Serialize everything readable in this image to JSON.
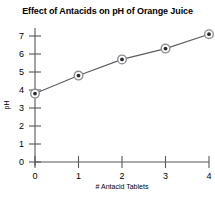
{
  "chart_data": {
    "type": "line",
    "title": "Effect of Antacids on pH of Orange Juice",
    "xlabel": "# Antacid Tablets",
    "ylabel": "pH",
    "x": [
      0,
      1,
      2,
      3,
      4
    ],
    "values": [
      3.8,
      4.8,
      5.7,
      6.3,
      7.1
    ],
    "categories": [
      "0",
      "1",
      "2",
      "3",
      "4"
    ],
    "xlim": [
      0,
      4
    ],
    "ylim": [
      0,
      7
    ],
    "xticks": [
      "0",
      "1",
      "2",
      "3",
      "4"
    ],
    "yticks": [
      "0",
      "1",
      "2",
      "3",
      "4",
      "5",
      "6",
      "7"
    ],
    "grid": false,
    "legend": false,
    "marker": "circle",
    "line_color": "#5a5c5f",
    "marker_fill": "#2b2c2e",
    "marker_ring": "#8d8f92",
    "axis_color": "#55575a",
    "background": "#ffffff"
  }
}
